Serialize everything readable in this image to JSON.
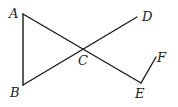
{
  "diagram": {
    "points": {
      "A": {
        "label": "A",
        "x": 23,
        "y": 14,
        "lx": 9,
        "ly": 18
      },
      "B": {
        "label": "B",
        "x": 23,
        "y": 85,
        "lx": 10,
        "ly": 97
      },
      "C": {
        "label": "C",
        "x": 85,
        "y": 50,
        "lx": 78,
        "ly": 65
      },
      "D": {
        "label": "D",
        "x": 137,
        "y": 17,
        "lx": 142,
        "ly": 21
      },
      "E": {
        "label": "E",
        "x": 141,
        "y": 83,
        "lx": 135,
        "ly": 98
      },
      "F": {
        "label": "F",
        "x": 156,
        "y": 57,
        "lx": 157,
        "ly": 62
      }
    },
    "segments": [
      [
        "A",
        "B"
      ],
      [
        "A",
        "E"
      ],
      [
        "B",
        "D"
      ],
      [
        "E",
        "F"
      ]
    ],
    "stroke_color": "#1a1a1a"
  }
}
